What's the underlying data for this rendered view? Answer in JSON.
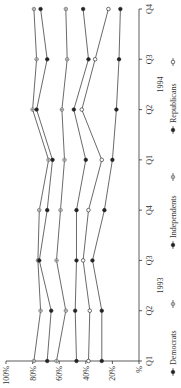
{
  "chart_data": {
    "type": "line",
    "orientation": "rotated 90° counter-clockwise",
    "title": "",
    "xlabel": "",
    "ylabel": "%",
    "ylim": [
      0,
      100
    ],
    "yticks": [
      "%",
      "20%",
      "40%",
      "60%",
      "80%",
      "100%"
    ],
    "categories": [
      "Q1",
      "Q2",
      "Q3",
      "Q4",
      "Q1",
      "Q2",
      "Q3",
      "Q4"
    ],
    "year_labels": [
      {
        "label": "1993",
        "position": 1.5
      },
      {
        "label": "1994",
        "position": 5.5
      }
    ],
    "grid": false,
    "legend_position": "bottom",
    "legend": [
      {
        "label": "Democrats",
        "marker": "filled"
      },
      {
        "label": "Independents",
        "marker": "filled"
      },
      {
        "label": "Republicans",
        "marker": "filled"
      }
    ],
    "series": [
      {
        "name": "Democrats (+)",
        "marker": "plus",
        "values": [
          79,
          74,
          76,
          75,
          68,
          80,
          77,
          79
        ]
      },
      {
        "name": "Democrats (●)",
        "marker": "filled",
        "values": [
          69,
          66,
          75,
          69,
          65,
          77,
          69,
          74
        ]
      },
      {
        "name": "Independents (+)",
        "marker": "plus",
        "values": [
          62,
          55,
          62,
          59,
          56,
          58,
          54,
          55
        ]
      },
      {
        "name": "Independents (●)",
        "marker": "filled",
        "values": [
          47,
          48,
          47,
          47,
          40,
          49,
          38,
          42
        ]
      },
      {
        "name": "Republicans (○)",
        "marker": "open",
        "values": [
          38,
          37,
          42,
          38,
          28,
          43,
          33,
          23
        ]
      },
      {
        "name": "Republicans (●)",
        "marker": "filled",
        "values": [
          28,
          28,
          35,
          26,
          20,
          17,
          15,
          14
        ]
      }
    ]
  }
}
